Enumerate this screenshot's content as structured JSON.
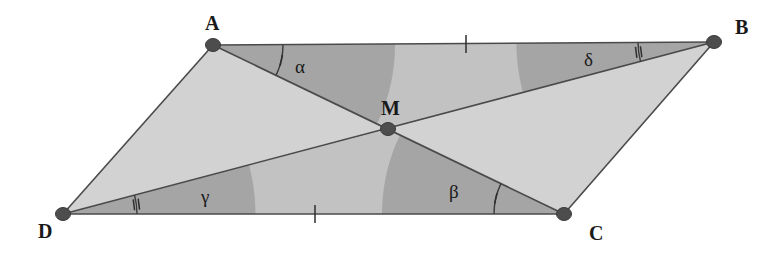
{
  "figure": {
    "type": "geometry-diagram",
    "shape": "parallelogram",
    "background_color": "#ffffff",
    "fill_light": "#d2d2d2",
    "fill_mid": "#c2c2c2",
    "fill_dark": "#a5a5a5",
    "stroke_color": "#4a4a4a",
    "vertex_color": "#4d4d4d"
  },
  "vertices": {
    "A": {
      "label": "A",
      "x": 213,
      "y": 45,
      "label_x": 205,
      "label_y": 30
    },
    "B": {
      "label": "B",
      "x": 714,
      "y": 42,
      "label_x": 735,
      "label_y": 34
    },
    "C": {
      "label": "C",
      "x": 564,
      "y": 214,
      "label_x": 589,
      "label_y": 240
    },
    "D": {
      "label": "D",
      "x": 63,
      "y": 214,
      "label_x": 38,
      "label_y": 238
    },
    "M": {
      "label": "M",
      "x": 388,
      "y": 129,
      "label_x": 381,
      "label_y": 115
    }
  },
  "edges": [
    {
      "name": "AB",
      "from": "A",
      "to": "B",
      "ticks": 1,
      "tick_x": 466,
      "tick_y": 44
    },
    {
      "name": "BC",
      "from": "B",
      "to": "C",
      "ticks": 0
    },
    {
      "name": "DC",
      "from": "D",
      "to": "C",
      "ticks": 1,
      "tick_x": 315,
      "tick_y": 214
    },
    {
      "name": "AD",
      "from": "A",
      "to": "D",
      "ticks": 0
    }
  ],
  "diagonals": [
    {
      "name": "AC",
      "from": "A",
      "to": "C"
    },
    {
      "name": "DB",
      "from": "D",
      "to": "B"
    }
  ],
  "angles": [
    {
      "id": "alpha",
      "symbol": "α",
      "vertex": "A",
      "between": [
        "AB",
        "AC"
      ],
      "ticks": 1,
      "label_x": 295,
      "label_y": 73,
      "arc_radius": 70
    },
    {
      "id": "delta",
      "symbol": "δ",
      "vertex": "B",
      "between": [
        "BA",
        "BD"
      ],
      "ticks": 2,
      "label_x": 584,
      "label_y": 66,
      "arc_radius": 76
    },
    {
      "id": "gamma",
      "symbol": "γ",
      "vertex": "D",
      "between": [
        "DC",
        "DB"
      ],
      "ticks": 2,
      "label_x": 201,
      "label_y": 203,
      "arc_radius": 74
    },
    {
      "id": "beta",
      "symbol": "β",
      "vertex": "C",
      "between": [
        "CD",
        "CA"
      ],
      "ticks": 1,
      "label_x": 449,
      "label_y": 198,
      "arc_radius": 70
    }
  ],
  "caption": {
    "alt": "Parallelogram ABCD with diagonals AC and DB meeting at midpoint M; angles alpha at A and beta at C marked with single ticks, angles gamma at D and delta at B marked with double ticks; sides AB and DC each marked with one tick."
  }
}
